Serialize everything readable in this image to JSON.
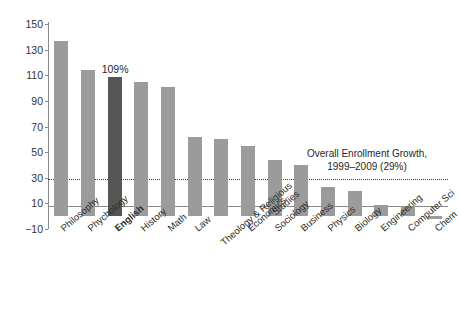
{
  "chart_data": {
    "type": "bar",
    "title": "",
    "xlabel": "",
    "ylabel": "",
    "ylim": [
      -10,
      150
    ],
    "grid": false,
    "legend": "none",
    "yticks": [
      150,
      130,
      110,
      90,
      70,
      50,
      30,
      10,
      -10
    ],
    "ytick_labels": [
      "150",
      "130",
      "110",
      "90",
      "70",
      "50",
      "30",
      "10",
      "−10"
    ],
    "categories": [
      "Philosophy",
      "Phychology",
      "English",
      "History",
      "Math",
      "Theology & Religious Studies",
      "Economics",
      "Sociology",
      "Business",
      "Physics",
      "Biology",
      "Engineering",
      "Computer Sci",
      "Chem"
    ],
    "bars": [
      {
        "label": "Philosophy",
        "label_l1": "Philosophy",
        "label_l2": "",
        "value": 137,
        "highlight": false
      },
      {
        "label": "Phychology",
        "label_l1": "Phychology",
        "label_l2": "",
        "value": 114,
        "highlight": false
      },
      {
        "label": "English",
        "label_l1": "English",
        "label_l2": "",
        "value": 109,
        "highlight": true
      },
      {
        "label": "History",
        "label_l1": "History",
        "label_l2": "",
        "value": 105,
        "highlight": false
      },
      {
        "label": "Math",
        "label_l1": "Math",
        "label_l2": "",
        "value": 101,
        "highlight": false
      },
      {
        "label": "Law",
        "label_l1": "Law",
        "label_l2": "",
        "value": 62,
        "highlight": false
      },
      {
        "label": "Theology & Religious Studies",
        "label_l1": "Theology & Religious",
        "label_l2": "Studies",
        "value": 60,
        "highlight": false
      },
      {
        "label": "Economics",
        "label_l1": "Economics",
        "label_l2": "",
        "value": 55,
        "highlight": false
      },
      {
        "label": "Sociology",
        "label_l1": "Sociology",
        "label_l2": "",
        "value": 44,
        "highlight": false
      },
      {
        "label": "Business",
        "label_l1": "Business",
        "label_l2": "",
        "value": 40,
        "highlight": false
      },
      {
        "label": "Physics",
        "label_l1": "Physics",
        "label_l2": "",
        "value": 23,
        "highlight": false
      },
      {
        "label": "Biology",
        "label_l1": "Biology",
        "label_l2": "",
        "value": 20,
        "highlight": false
      },
      {
        "label": "Engineering",
        "label_l1": "Engineering",
        "label_l2": "",
        "value": 9,
        "highlight": false
      },
      {
        "label": "Computer Sci",
        "label_l1": "Computer Sci",
        "label_l2": "",
        "value": 8,
        "highlight": false
      },
      {
        "label": "Chem",
        "label_l1": "Chem",
        "label_l2": "",
        "value": -2,
        "highlight": false
      }
    ],
    "annotations": [
      {
        "name": "english-value",
        "text": "109%",
        "target": "English",
        "value": 109
      },
      {
        "name": "overall-enrollment-growth",
        "line1": "Overall Enrollment Growth,",
        "line2": "1999–2009 (29%)",
        "reference_value": 29
      }
    ],
    "colors": {
      "bar": "#9b9b9b",
      "bar_highlight": "#565656",
      "axis": "#8a8a8a",
      "reference_line": "#3d3d3d",
      "text": "#2b2b2b",
      "background": "#ffffff"
    }
  },
  "caption": {
    "text": ""
  }
}
